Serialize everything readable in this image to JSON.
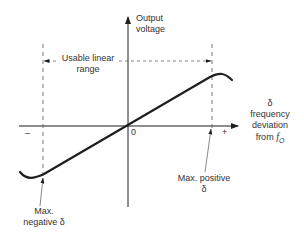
{
  "diagram": {
    "type": "discriminator-characteristic",
    "y_axis": {
      "label_line1": "Output",
      "label_line2": "voltage"
    },
    "x_axis": {
      "label_line1": "δ",
      "label_line2": "frequency",
      "label_line3": "deviation",
      "label_line4_prefix": "from ",
      "label_line4_var": "f",
      "label_line4_sub": "O"
    },
    "origin_label": "0",
    "minus_label": "–",
    "plus_label": "+",
    "range": {
      "label_line1": "Usable linear",
      "label_line2": "range"
    },
    "max_positive": {
      "label_line1": "Max. positive",
      "label_line2": "δ"
    },
    "max_negative": {
      "label_line1": "Max.",
      "label_line2": "negative δ"
    },
    "colors": {
      "ink": "#1e1e1e",
      "text": "#333333",
      "background": "#ffffff"
    }
  }
}
